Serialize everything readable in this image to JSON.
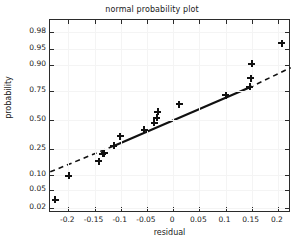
{
  "chart_data": {
    "type": "scatter",
    "title": "normal probability plot",
    "xlabel": "residual",
    "ylabel": "probability",
    "xlim": [
      -0.235,
      0.225
    ],
    "ylim_prob": [
      0.015,
      0.99
    ],
    "grid": true,
    "legend": null,
    "xticks": [
      -0.2,
      -0.15,
      -0.1,
      -0.05,
      0,
      0.05,
      0.1,
      0.15,
      0.2
    ],
    "xticklabels": [
      "-0.2",
      "-0.15",
      "-0.1",
      "-0.05",
      "0",
      "0.05",
      "0.1",
      "0.15",
      "0.2"
    ],
    "yticks": [
      0.02,
      0.05,
      0.1,
      0.25,
      0.5,
      0.75,
      0.9,
      0.95,
      0.98
    ],
    "yticklabels": [
      "0.02",
      "0.05",
      "0.10",
      "0.25",
      "0.50",
      "0.75",
      "0.90",
      "0.95",
      "0.98"
    ],
    "marker": "+",
    "marker_color": "#111111",
    "line_color": "#111111",
    "points": [
      {
        "x": -0.225,
        "p": 0.031
      },
      {
        "x": -0.199,
        "p": 0.097
      },
      {
        "x": -0.142,
        "p": 0.168
      },
      {
        "x": -0.134,
        "p": 0.215
      },
      {
        "x": -0.131,
        "p": 0.218
      },
      {
        "x": -0.113,
        "p": 0.275
      },
      {
        "x": -0.101,
        "p": 0.35
      },
      {
        "x": -0.055,
        "p": 0.41
      },
      {
        "x": -0.036,
        "p": 0.472
      },
      {
        "x": -0.031,
        "p": 0.52
      },
      {
        "x": -0.029,
        "p": 0.575
      },
      {
        "x": 0.012,
        "p": 0.64
      },
      {
        "x": 0.1,
        "p": 0.718
      },
      {
        "x": 0.146,
        "p": 0.779
      },
      {
        "x": 0.148,
        "p": 0.833
      },
      {
        "x": 0.15,
        "p": 0.905
      },
      {
        "x": 0.207,
        "p": 0.963
      }
    ],
    "reference_line": {
      "style": "solid-center-dashed-ends",
      "solid_segment": {
        "x0": -0.1155,
        "p0": 0.268,
        "x1": 0.1445,
        "p1": 0.772
      },
      "dashed_lower": {
        "x0": -0.2345,
        "p0": 0.113,
        "x1": -0.1155,
        "p1": 0.268
      },
      "dashed_upper": {
        "x0": 0.1445,
        "p0": 0.772,
        "x1": 0.2245,
        "p1": 0.888
      }
    }
  },
  "figure": {
    "background": "#ffffff",
    "axis_color": "#2b2b2b",
    "grid_color": "#f4f4f4"
  }
}
